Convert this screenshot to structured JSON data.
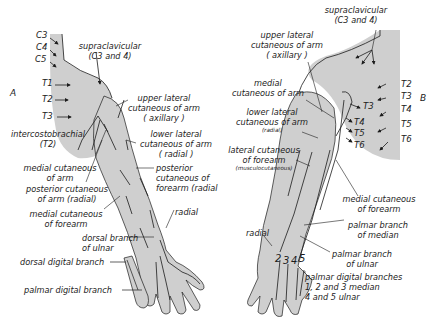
{
  "figure": {
    "fill_color": "#cfcfcf",
    "line_color": "#1c1c1c",
    "panels": {
      "A": {
        "letter": "A",
        "segments": [
          "C3",
          "C4",
          "C5",
          "T1",
          "T2",
          "T3"
        ],
        "labels": {
          "supraclavicular": "supraclavicular",
          "supraclavicular_roots": "(C3 and 4)",
          "upper_lateral_1": "upper lateral",
          "upper_lateral_2": "cutaneous of arm",
          "upper_lateral_3": "( axillary )",
          "intercostobrachial_1": "intercostobrachial",
          "intercostobrachial_2": "(T2)",
          "lower_lateral_1": "lower lateral",
          "lower_lateral_2": "cutaneous of arm",
          "lower_lateral_3": "( radial )",
          "medial_cut_arm_1": "medial cutaneous",
          "medial_cut_arm_2": "of arm",
          "posterior_cut_forearm_1": "posterior",
          "posterior_cut_forearm_2": "cutaneous of",
          "posterior_cut_forearm_3": "forearm (radial",
          "posterior_cut_arm_1": "posterior cutaneous",
          "posterior_cut_arm_2": "of arm (radial)",
          "medial_cut_forearm_1": "medial cutaneous",
          "medial_cut_forearm_2": "of forearm",
          "radial": "radial",
          "dorsal_branch_ulnar_1": "dorsal branch",
          "dorsal_branch_ulnar_2": "of ulnar",
          "dorsal_digital": "dorsal digital branch",
          "palmar_digital": "palmar digital  branch"
        }
      },
      "B": {
        "letter": "B",
        "segments_trunk": [
          "T2",
          "T3",
          "T4",
          "T5",
          "T6"
        ],
        "segments_axilla": [
          "T3",
          "T4",
          "T5",
          "T6"
        ],
        "digits": [
          "2",
          "3",
          "4",
          "5"
        ],
        "labels": {
          "supraclavicular": "supraclavicular",
          "supraclavicular_roots": "(C3 and 4)",
          "upper_lateral_1": "upper lateral",
          "upper_lateral_2": "cutaneous of arm",
          "upper_lateral_3": "( axillary )",
          "medial_cut_arm_1": "medial",
          "medial_cut_arm_2": "cutaneous of arm",
          "lower_lateral_1": "lower lateral",
          "lower_lateral_2": "cutaneous of arm",
          "lower_lateral_3": "(radial)",
          "lateral_cut_forearm_1": "lateral cutaneous",
          "lateral_cut_forearm_2": "of forearm",
          "lateral_cut_forearm_3": "(musculocutaneous)",
          "medial_cut_forearm_1": "medial cutaneous",
          "medial_cut_forearm_2": "of forearm",
          "radial": "radial",
          "palmar_median_1": "palmar branch",
          "palmar_median_2": "of median",
          "palmar_ulnar_1": "palmar branch",
          "palmar_ulnar_2": "of ulnar",
          "palmar_digital_1": "palmar digital branches",
          "palmar_digital_2": "1, 2 and 3 median",
          "palmar_digital_3": "4 and 5 ulnar"
        }
      }
    }
  }
}
